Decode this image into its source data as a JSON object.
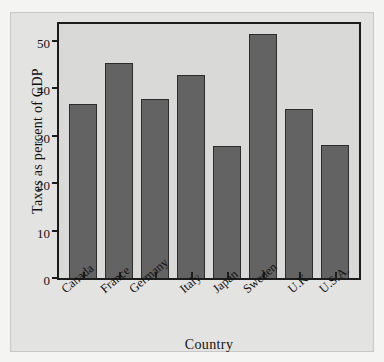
{
  "chart_data": {
    "type": "bar",
    "title": "",
    "xlabel": "Country",
    "ylabel": "Taxes as percent of GDP",
    "categories": [
      "Canada",
      "France",
      "Germany",
      "Italy",
      "Japan",
      "Sweden",
      "U.K.",
      "U.S.A."
    ],
    "values": [
      36.6,
      45.2,
      37.7,
      42.7,
      27.8,
      51.3,
      35.6,
      28.0
    ],
    "ylim": [
      0,
      53.5
    ],
    "yticks": [
      0,
      10,
      20,
      30,
      40,
      50
    ],
    "ytick_labels": [
      "0",
      "10",
      "20",
      "30",
      "40",
      "50"
    ],
    "grid": false,
    "legend": null,
    "bar_color": "#636363",
    "bar_edge_color": "#2c2c2c",
    "plot_background": "#d9d9d7",
    "figure_background": "#e3e3e1",
    "axis_color": "#1c1c1c"
  }
}
